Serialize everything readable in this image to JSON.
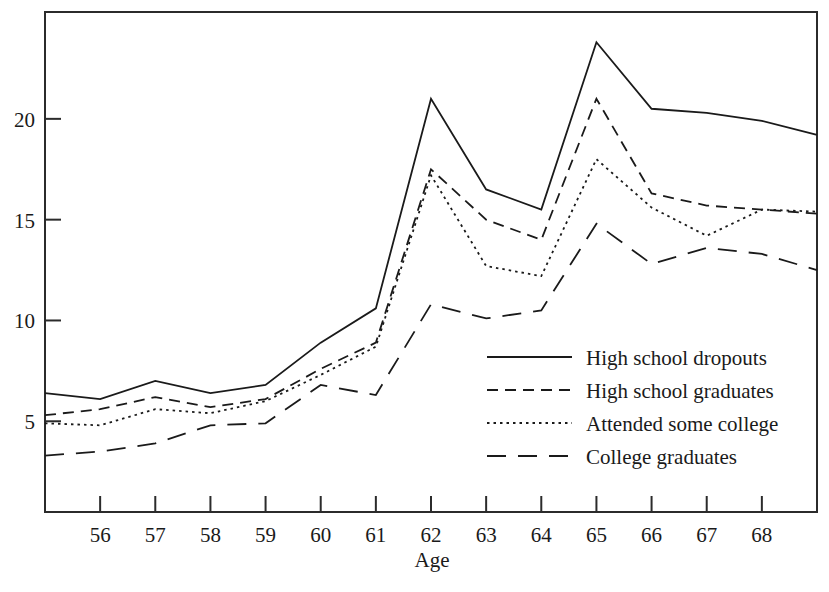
{
  "chart_data": {
    "type": "line",
    "title": "",
    "xlabel": "Age",
    "ylabel": "",
    "xlim": [
      55,
      69
    ],
    "ylim": [
      0.5,
      25.3
    ],
    "grid": false,
    "legend_position": "center-right",
    "x": [
      55,
      56,
      57,
      58,
      59,
      60,
      61,
      62,
      63,
      64,
      65,
      66,
      67,
      68,
      69
    ],
    "xticks": [
      56,
      57,
      58,
      59,
      60,
      61,
      62,
      63,
      64,
      65,
      66,
      67,
      68
    ],
    "xtick_labels": [
      "56",
      "57",
      "58",
      "59",
      "60",
      "61",
      "62",
      "63",
      "64",
      "65",
      "66",
      "67",
      "68"
    ],
    "yticks": [
      5,
      10,
      15,
      20
    ],
    "ytick_labels": [
      "5",
      "10",
      "15",
      "20"
    ],
    "series": [
      {
        "name": "High school dropouts",
        "style": "solid",
        "values": [
          6.4,
          6.1,
          7.0,
          6.4,
          6.8,
          8.9,
          10.6,
          21.0,
          16.5,
          15.5,
          23.8,
          20.5,
          20.3,
          19.9,
          19.2
        ]
      },
      {
        "name": "High school graduates",
        "style": "dashed",
        "values": [
          5.3,
          5.6,
          6.2,
          5.7,
          6.1,
          7.6,
          8.9,
          17.5,
          15.0,
          14.0,
          21.0,
          16.3,
          15.7,
          15.5,
          15.3
        ]
      },
      {
        "name": "Attended some college",
        "style": "dotted",
        "values": [
          4.9,
          4.8,
          5.6,
          5.4,
          6.0,
          7.3,
          8.7,
          17.2,
          12.7,
          12.2,
          18.0,
          15.6,
          14.2,
          15.5,
          15.4
        ]
      },
      {
        "name": "College graduates",
        "style": "longdash",
        "values": [
          3.3,
          3.5,
          3.9,
          4.8,
          4.9,
          6.8,
          6.3,
          10.8,
          10.1,
          10.5,
          14.8,
          12.8,
          13.6,
          13.3,
          12.5
        ]
      }
    ]
  },
  "legend": {
    "entries": [
      {
        "label": "High school dropouts"
      },
      {
        "label": "High school graduates"
      },
      {
        "label": "Attended some college"
      },
      {
        "label": "College graduates"
      }
    ]
  }
}
